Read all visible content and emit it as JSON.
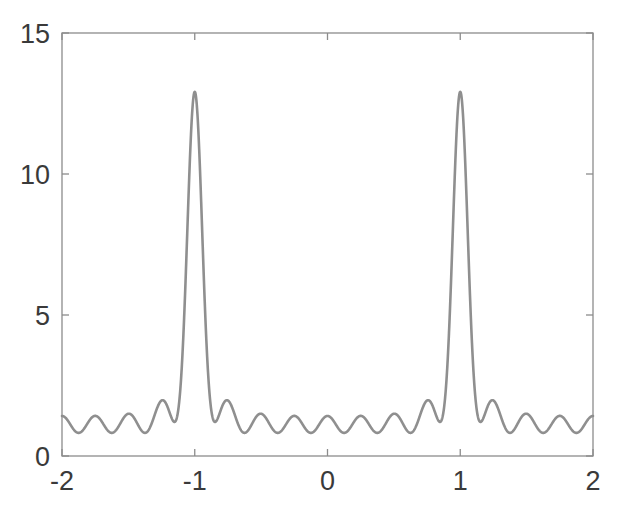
{
  "figure": {
    "background_color": "#ffffff",
    "axes_color": "#8c8c8c",
    "tick_label_color": "#3a3a3a",
    "line_color": "#8f8f8f"
  },
  "chart_data": {
    "type": "line",
    "title": "",
    "xlabel": "",
    "ylabel": "",
    "xlim": [
      -2,
      2
    ],
    "ylim": [
      0,
      15
    ],
    "xticks": [
      -2,
      -1,
      0,
      1,
      2
    ],
    "xtick_labels": [
      "-2",
      "-1",
      "0",
      "1",
      "2"
    ],
    "yticks": [
      0,
      5,
      10,
      15
    ],
    "ytick_labels": [
      "0",
      "5",
      "10",
      "15"
    ],
    "grid": false,
    "legend": null,
    "box": true,
    "series": [
      {
        "name": "intensity",
        "description": "Multi-slit interference pattern: two principal maxima at x = -1 and x = +1 of height 11.5, separated by oscillatory secondary maxima with baseline near 1",
        "peak_positions": [
          -1,
          1
        ],
        "peak_height": 11.5,
        "baseline_min": 0.75,
        "baseline_max": 1.5,
        "formula": "f(x) = (sin(N*pi*(x))/sin(pi*(x)))^2 normalized, N=3.4 envelope",
        "x": [
          -2.0,
          -1.96,
          -1.92,
          -1.88,
          -1.84,
          -1.8,
          -1.76,
          -1.72,
          -1.68,
          -1.64,
          -1.6,
          -1.56,
          -1.52,
          -1.48,
          -1.44,
          -1.4,
          -1.36,
          -1.32,
          -1.28,
          -1.24,
          -1.2,
          -1.16,
          -1.12,
          -1.08,
          -1.04,
          -1.0,
          -0.96,
          -0.92,
          -0.88,
          -0.84,
          -0.8,
          -0.76,
          -0.72,
          -0.68,
          -0.64,
          -0.6,
          -0.56,
          -0.52,
          -0.48,
          -0.44,
          -0.4,
          -0.36,
          -0.32,
          -0.28,
          -0.24,
          -0.2,
          -0.16,
          -0.12,
          -0.08,
          -0.04,
          0.0,
          0.04,
          0.08,
          0.12,
          0.16,
          0.2,
          0.24,
          0.28,
          0.32,
          0.36,
          0.4,
          0.44,
          0.48,
          0.52,
          0.56,
          0.6,
          0.64,
          0.68,
          0.72,
          0.76,
          0.8,
          0.84,
          0.88,
          0.92,
          0.96,
          1.0,
          1.04,
          1.08,
          1.12,
          1.16,
          1.2,
          1.24,
          1.28,
          1.32,
          1.36,
          1.4,
          1.44,
          1.48,
          1.52,
          1.56,
          1.6,
          1.64,
          1.68,
          1.72,
          1.76,
          1.8,
          1.84,
          1.88,
          1.92,
          1.96,
          2.0
        ],
        "y": [
          1.25,
          1.2,
          1.0,
          0.85,
          0.9,
          1.15,
          1.3,
          1.25,
          1.0,
          0.85,
          0.95,
          1.25,
          1.5,
          1.45,
          1.15,
          0.9,
          1.0,
          1.45,
          1.9,
          2.0,
          1.7,
          1.2,
          1.35,
          2.6,
          6.2,
          11.5,
          6.2,
          2.6,
          1.35,
          1.2,
          1.7,
          2.0,
          1.9,
          1.45,
          1.0,
          0.9,
          1.15,
          1.45,
          1.5,
          1.25,
          0.95,
          0.85,
          1.0,
          1.25,
          1.3,
          1.15,
          0.9,
          0.85,
          1.0,
          1.2,
          1.25,
          1.2,
          1.0,
          0.85,
          0.9,
          1.15,
          1.3,
          1.25,
          1.0,
          0.85,
          0.95,
          1.25,
          1.5,
          1.45,
          1.15,
          0.9,
          1.0,
          1.45,
          1.9,
          2.0,
          1.7,
          1.2,
          1.35,
          2.6,
          6.2,
          11.5,
          6.2,
          2.6,
          1.35,
          1.2,
          1.7,
          2.0,
          1.9,
          1.45,
          1.0,
          0.9,
          1.15,
          1.45,
          1.5,
          1.25,
          0.95,
          0.85,
          1.0,
          1.25,
          1.3,
          1.15,
          0.9,
          0.85,
          1.0,
          1.2,
          1.25
        ]
      }
    ]
  }
}
